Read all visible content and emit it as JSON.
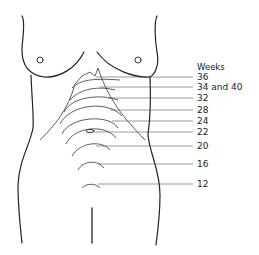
{
  "diagram": {
    "title": "Weeks",
    "labels": [
      {
        "text": "36",
        "y": 77
      },
      {
        "text": "34 and 40",
        "y": 87
      },
      {
        "text": "32",
        "y": 98
      },
      {
        "text": "28",
        "y": 110
      },
      {
        "text": "24",
        "y": 121
      },
      {
        "text": "22",
        "y": 132
      },
      {
        "text": "20",
        "y": 146
      },
      {
        "text": "16",
        "y": 164
      },
      {
        "text": "12",
        "y": 184
      }
    ],
    "line_color": "#222222",
    "background": "#ffffff"
  }
}
